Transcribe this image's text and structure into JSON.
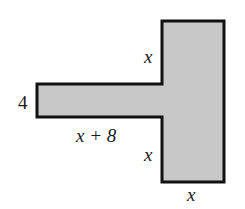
{
  "diagram": {
    "type": "geometry-figure",
    "shape": "T-shaped polygon (shaded)",
    "fill_color": "#c8c8c8",
    "stroke_color": "#111111",
    "labels": {
      "arm_height": "4",
      "arm_length": "x + 8",
      "upper_stem_segment": "x",
      "lower_stem_segment": "x",
      "stem_width": "x"
    }
  }
}
